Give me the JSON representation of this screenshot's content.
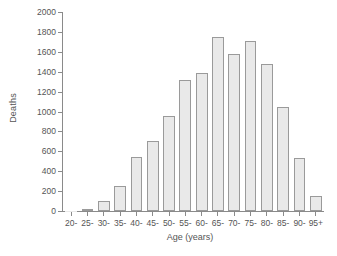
{
  "chart_data": {
    "type": "bar",
    "title": "",
    "xlabel": "Age (years)",
    "ylabel": "Deaths",
    "categories": [
      "20-",
      "25-",
      "30-",
      "35-",
      "40-",
      "45-",
      "50-",
      "55-",
      "60-",
      "65-",
      "70-",
      "75-",
      "80-",
      "85-",
      "90-",
      "95+"
    ],
    "values": [
      5,
      25,
      100,
      255,
      540,
      700,
      950,
      1315,
      1390,
      1750,
      1575,
      1710,
      1480,
      1050,
      530,
      150
    ],
    "ylim": [
      0,
      2000
    ],
    "ytick_values": [
      0,
      200,
      400,
      600,
      800,
      1000,
      1200,
      1400,
      1600,
      1800,
      2000
    ],
    "ytick_labels": [
      "0",
      "200",
      "400",
      "600",
      "800",
      "1000",
      "1200",
      "1400",
      "1600",
      "1800",
      "2000"
    ],
    "grid": false,
    "legend": null,
    "bar_fill_color": "#e9e9e9",
    "bar_border_color": "#9a9a9a",
    "axis_color": "#8a8a8a",
    "text_color": "#555555",
    "background_color": "#ffffff"
  }
}
